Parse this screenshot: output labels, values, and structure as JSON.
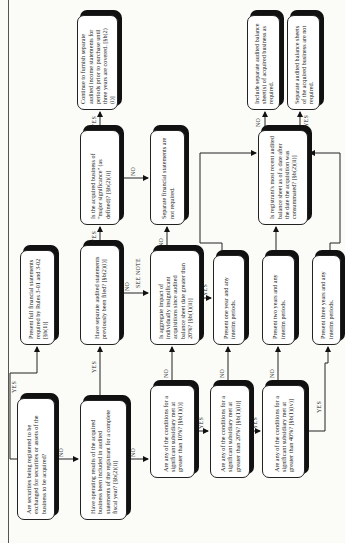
{
  "flowchart": {
    "nodes": {
      "q_exchange": "Are securities being registered to be exchanged for securities or assets of the business to be acquired?",
      "q_operating": "Have operating results of the acquired business been included in audited statements of the registrant for a complete fiscal year? [§b(2)(i)]",
      "present_full": "Present full financial statements required by Rules 3-01 and 3-02 [§b(1)]",
      "q_separate_filed": "Have separate audited statements previously been filed? [§b(2)(i)]",
      "q_major": "Is the acquired business of \"major significance\" (as defined)? [§b(2)(i)]",
      "continue_furnish": "Continue to furnish separate audited income statements for periods prior to purchase until three years are covered. [§b(2)(i)]",
      "sep_not_required": "Separate financial statements are not required.",
      "q_aggregate": "Is aggregate impact of individually insignificant acquisitions since audited balance sheet date greater than 20%? [§b(1)(ii)]",
      "q_10": "Are any of the conditions for a significant subsidiary met at greater than 10%? [§b(1)(i)]",
      "q_20": "Are any of the conditions for a significant subsidiary met at greater than 20%? [§b(1)(ii)]",
      "q_40": "Are any of the conditions for a significant subsidiary met at greater than 40%? [§b(1)(iv)]",
      "present_one": "Present one year and any interim periods.",
      "present_two": "Present two years and any interim periods.",
      "present_three": "Present three years and any interim periods.",
      "q_registrant_bs": "Is registrant's most recent audited balance sheet as of a date after the date the acquisition was consummated? [§b(2)(ii)]",
      "include_bs": "Include separate audited balance sheet(s) of acquired business as required.",
      "bs_not_required": "Separate audited balance sheets of the acquired business are not required."
    },
    "labels": {
      "yes": "YES",
      "no": "NO",
      "see_note": "SEE NOTE"
    }
  }
}
